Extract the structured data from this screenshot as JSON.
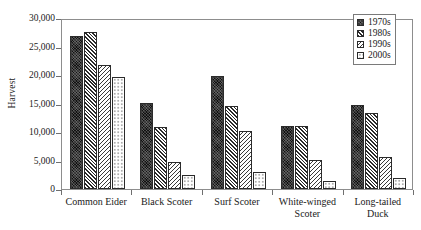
{
  "chart_data": {
    "type": "bar",
    "title": "",
    "xlabel": "",
    "ylabel": "Harvest",
    "ylim": [
      0,
      30000
    ],
    "yticks": [
      0,
      5000,
      10000,
      15000,
      20000,
      25000,
      30000
    ],
    "ytick_labels": [
      "0",
      "5,000",
      "10,000",
      "15,000",
      "20,000",
      "25,000",
      "30,000"
    ],
    "grid": false,
    "legend_position": "top-right",
    "categories": [
      "Common Eider",
      "Black Scoter",
      "Surf Scoter",
      "White-winged\nScoter",
      "Long-tailed\nDuck"
    ],
    "series": [
      {
        "name": "1970s",
        "pattern": "solid-black",
        "values": [
          26900,
          15100,
          19800,
          11000,
          14700
        ]
      },
      {
        "name": "1980s",
        "pattern": "dark-crosshatch",
        "values": [
          27500,
          10900,
          14500,
          11100,
          13300
        ]
      },
      {
        "name": "1990s",
        "pattern": "light-hatch",
        "values": [
          21800,
          4700,
          10200,
          5100,
          5700
        ]
      },
      {
        "name": "2000s",
        "pattern": "dotted-white",
        "values": [
          19700,
          2400,
          3000,
          1400,
          1900
        ]
      }
    ]
  },
  "legend": {
    "items": [
      {
        "label": "1970s"
      },
      {
        "label": "1980s"
      },
      {
        "label": "1990s"
      },
      {
        "label": "2000s"
      }
    ]
  },
  "colors": {
    "series_1970s": "#111111",
    "series_1980s": "#2a2a2a",
    "series_1990s": "#3a3a3a",
    "series_2000s": "#ffffff",
    "axis": "#6f6f6f",
    "frame": "#8d8d8d",
    "text": "#1a1a1a",
    "background": "#ffffff"
  }
}
